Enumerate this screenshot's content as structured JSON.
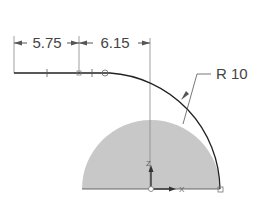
{
  "dimensions": {
    "left_length": "5.75",
    "right_length": "6.15",
    "radius_label": "R 10"
  },
  "axes": {
    "z_label": "Z",
    "x_label": "X"
  },
  "colors": {
    "line": "#222222",
    "dim_line": "#555555",
    "fill": "#c8c8c8",
    "construction": "#888888"
  }
}
